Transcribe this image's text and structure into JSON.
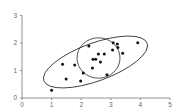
{
  "chart_data": {
    "type": "scatter",
    "title": "",
    "xlabel": "",
    "ylabel": "",
    "xlim": [
      0,
      5
    ],
    "ylim": [
      0,
      3
    ],
    "grid": false,
    "legend": null,
    "x_ticks": [
      "0",
      "1",
      "2",
      "3",
      "4",
      "5"
    ],
    "y_ticks": [
      "0",
      "1",
      "2",
      "3"
    ],
    "series": [
      {
        "name": "points",
        "points": [
          {
            "x": 1.0,
            "y": 0.28
          },
          {
            "x": 1.37,
            "y": 1.23
          },
          {
            "x": 1.49,
            "y": 0.69
          },
          {
            "x": 1.78,
            "y": 1.2
          },
          {
            "x": 1.98,
            "y": 0.62
          },
          {
            "x": 2.07,
            "y": 0.91
          },
          {
            "x": 2.26,
            "y": 1.89
          },
          {
            "x": 2.38,
            "y": 1.09
          },
          {
            "x": 2.4,
            "y": 1.41
          },
          {
            "x": 2.49,
            "y": 1.41
          },
          {
            "x": 2.58,
            "y": 1.6
          },
          {
            "x": 2.65,
            "y": 1.31
          },
          {
            "x": 2.78,
            "y": 1.6
          },
          {
            "x": 2.87,
            "y": 0.85
          },
          {
            "x": 3.06,
            "y": 1.75
          },
          {
            "x": 3.08,
            "y": 2.01
          },
          {
            "x": 3.22,
            "y": 1.96
          },
          {
            "x": 3.24,
            "y": 1.84
          },
          {
            "x": 3.4,
            "y": 1.63
          },
          {
            "x": 3.91,
            "y": 2.01
          }
        ]
      }
    ],
    "annotations": [
      {
        "shape": "ellipse",
        "description": "large tilted ellipse enclosing all points",
        "center": {
          "x": 2.48,
          "y": 1.33
        },
        "semi_major_x_units": 1.85,
        "angle_deg": 20
      },
      {
        "shape": "circle",
        "description": "smaller circle around central cluster",
        "center": {
          "x": 2.58,
          "y": 1.45
        },
        "radius_x_units": 0.73
      }
    ]
  }
}
